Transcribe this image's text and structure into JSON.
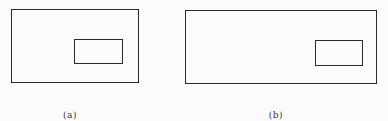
{
  "figures": [
    {
      "label": "(a)",
      "outer": {
        "x": 11,
        "y": 9,
        "w": 128,
        "h": 74
      },
      "inner": {
        "x": 74,
        "y": 39,
        "w": 49,
        "h": 25
      },
      "label_pos": {
        "x": 70,
        "y": 110
      }
    },
    {
      "label": "(b)",
      "outer": {
        "x": 185,
        "y": 10,
        "w": 192,
        "h": 74
      },
      "inner": {
        "x": 315,
        "y": 40,
        "w": 48,
        "h": 26
      },
      "label_pos": {
        "x": 276,
        "y": 110
      }
    }
  ],
  "colors": {
    "background": "#fbfbfb",
    "stroke": "#2a2a2a",
    "label": "#333333"
  }
}
